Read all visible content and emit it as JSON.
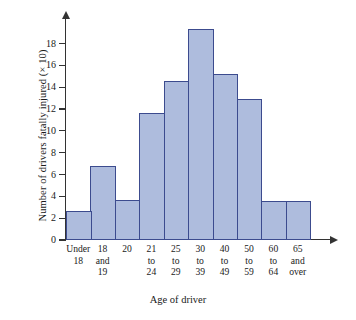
{
  "chart_data": {
    "type": "bar",
    "title": "",
    "subtitle": "",
    "xlabel": "Age of driver",
    "ylabel": "Number of drivers fatally injured (× 10)",
    "categories": [
      "Under 18",
      "18 and 19",
      "20",
      "21 to 24",
      "25 to 29",
      "30 to 39",
      "40 to 49",
      "50 to 59",
      "60 to 64",
      "65 and over"
    ],
    "category_lines": [
      [
        "Under",
        "18"
      ],
      [
        "18",
        "and",
        "19"
      ],
      [
        "20"
      ],
      [
        "21",
        "to",
        "24"
      ],
      [
        "25",
        "to",
        "29"
      ],
      [
        "30",
        "to",
        "39"
      ],
      [
        "40",
        "to",
        "49"
      ],
      [
        "50",
        "to",
        "59"
      ],
      [
        "60",
        "to",
        "64"
      ],
      [
        "65",
        "and",
        "over"
      ]
    ],
    "values": [
      2.7,
      6.8,
      3.7,
      11.6,
      14.6,
      19.3,
      15.2,
      12.9,
      3.6,
      3.6
    ],
    "ylim": [
      0,
      19.8
    ],
    "yticks": [
      0,
      2,
      4,
      6,
      8,
      10,
      12,
      14,
      16,
      18
    ],
    "ytick_labels": [
      "0",
      "2",
      "4",
      "6",
      "8",
      "10",
      "12",
      "14",
      "16",
      "18"
    ],
    "grid": false,
    "legend": null,
    "bar_fill_color": "#aebcdd",
    "bar_border_color": "#3c4b8e",
    "axis_color": "#333333",
    "background_color": "#ffffff"
  }
}
